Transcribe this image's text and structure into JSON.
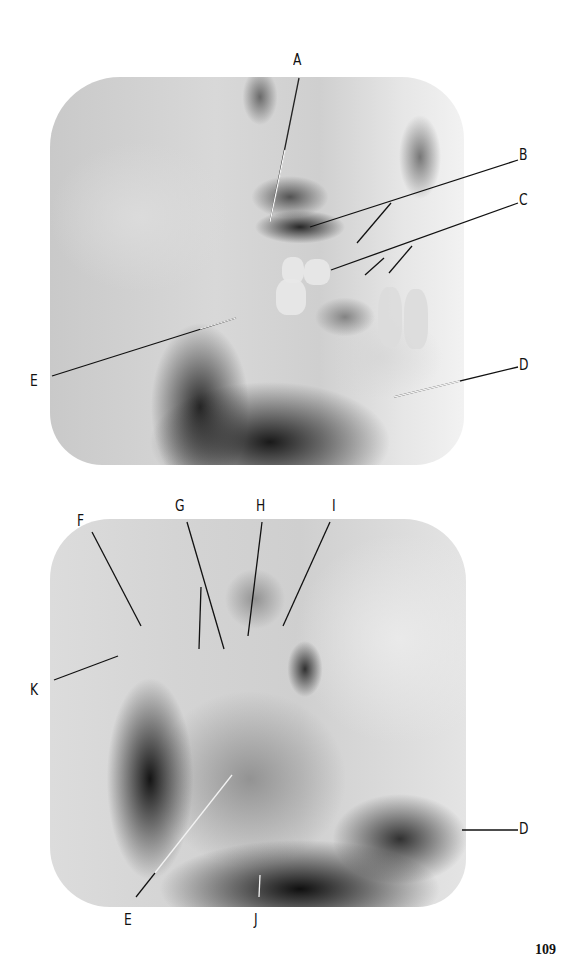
{
  "page": {
    "page_number": "109",
    "background_color": "#ffffff"
  },
  "figures": [
    {
      "id": "top",
      "description": "Lateral oblique radiograph of the mandible (upper figure)",
      "labels": [
        {
          "letter": "A",
          "x": 293,
          "y": 53
        },
        {
          "letter": "B",
          "x": 517,
          "y": 149
        },
        {
          "letter": "C",
          "x": 517,
          "y": 194
        },
        {
          "letter": "D",
          "x": 517,
          "y": 360
        },
        {
          "letter": "E",
          "x": 29,
          "y": 375
        }
      ]
    },
    {
      "id": "bottom",
      "description": "Lateral radiograph of the mandible (lower figure)",
      "labels": [
        {
          "letter": "F",
          "x": 77,
          "y": 514
        },
        {
          "letter": "G",
          "x": 175,
          "y": 499
        },
        {
          "letter": "H",
          "x": 256,
          "y": 499
        },
        {
          "letter": "I",
          "x": 332,
          "y": 499
        },
        {
          "letter": "K",
          "x": 30,
          "y": 683
        },
        {
          "letter": "D",
          "x": 517,
          "y": 829
        },
        {
          "letter": "E",
          "x": 122,
          "y": 919
        },
        {
          "letter": "J",
          "x": 253,
          "y": 919
        }
      ]
    }
  ]
}
